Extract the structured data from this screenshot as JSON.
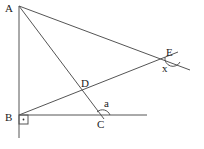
{
  "diagram": {
    "labels": {
      "A": "A",
      "B": "B",
      "C": "C",
      "D": "D",
      "E": "E"
    },
    "angles": {
      "a": "a",
      "x": "x"
    },
    "stroke_color": "#555555"
  }
}
